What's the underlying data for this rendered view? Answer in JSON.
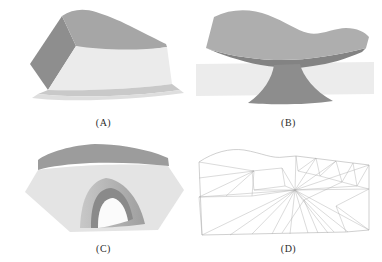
{
  "figure": {
    "background": "#ffffff",
    "label_color": "#2b2b2b",
    "panels": [
      {
        "label": "(A)",
        "colors": {
          "top": "#a6a6a6",
          "side": "#8e8e8e",
          "front": "#ebebeb",
          "skirt": "#c9c9c9",
          "skirt_outer": "#dedede"
        }
      },
      {
        "label": "(B)",
        "colors": {
          "cap_top": "#aeaeae",
          "cap_under": "#838383",
          "stem": "#8d8d8d",
          "ground": "#ececec"
        }
      },
      {
        "label": "(C)",
        "colors": {
          "band": "#9c9c9c",
          "front": "#e4e4e4",
          "arch_light": "#c8c8c8",
          "arch_dark": "#9e9e9e",
          "rim": "#8a8a8a",
          "opening": "#fbfbfb"
        }
      },
      {
        "label": "(D)",
        "colors": {
          "line": "#b0b0b0"
        }
      }
    ]
  }
}
